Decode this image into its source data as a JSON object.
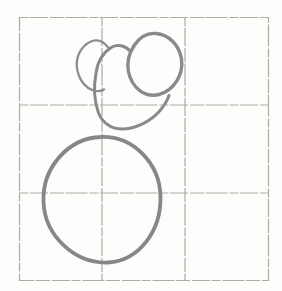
{
  "canvas": {
    "width": "282",
    "height": "291",
    "background": "#fdfdfc"
  },
  "grid": {
    "label": "3x3 pencil grid",
    "path": "M19.5,17.5 H268.5 V280.5 H19.5 Z M102,17.5 V280.5 M185,17.5 V280.5 M19.5,105 H268.5 M19.5,193 H268.5",
    "stroke_color": "#a5a19a",
    "stroke_width": "1.2",
    "dash_pattern": "9 1.5 18 2 14 1.5 22 2"
  },
  "shapes": [
    {
      "name": "small-oval-top-left",
      "kind": "open arc, right side hidden behind middle blob",
      "path": "M109,49 C105,42 98,38.5 91,41.5 C81,46 75.5,57 77,68 C78.5,79 85,88 94,90.5 C97.5,91.5 101,91.5 104,89.5",
      "stroke_color": "#8e8e8e",
      "stroke_width": "2.3"
    },
    {
      "name": "large-blob-middle",
      "kind": "open arc, upper-right hidden behind egg",
      "path": "M130,51 C125,45.5 117.5,44 112,47 C103,52.5 97.5,62 96,73 C93.5,87 94.5,102 98.5,113 C102.5,123 112,129.5 123.5,129 C137.5,128 152,120.5 160.5,110 C164.5,105 167.5,100 169,95.5",
      "stroke_color": "#8a8a8a",
      "stroke_width": "3"
    },
    {
      "name": "egg-top-right",
      "kind": "closed egg shape",
      "path": "M156,33.5 C168,34.5 179,44 181.5,59 C183.5,74 175,90 159,94.5 C145,98 132,88 128.5,72 C125,54 138,32 156,33.5 Z",
      "stroke_color": "#8a8a8a",
      "stroke_width": "3.4"
    },
    {
      "name": "large-circle-bottom",
      "kind": "closed hand-drawn circle",
      "path": "M101,137 C133,136 160,163 160.5,197 C161,231 139,261 108,262.5 C76,264 45,237 43.5,202 C42,168 68,138 101,137 Z",
      "stroke_color": "#878787",
      "stroke_width": "3.8"
    }
  ]
}
